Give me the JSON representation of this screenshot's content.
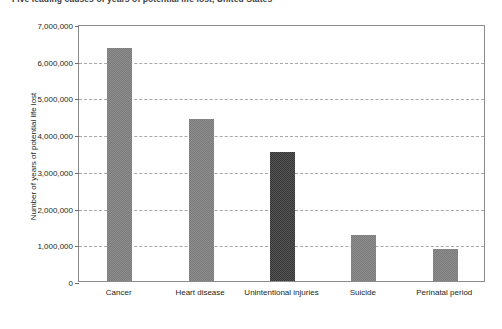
{
  "chart_data": {
    "type": "bar",
    "title": "Five leading causes of years of potential life lost, United States",
    "xlabel": "",
    "ylabel": "Number of years of potential life lost",
    "categories": [
      "Cancer",
      "Heart disease",
      "Unintentional injuries",
      "Suicide",
      "Perinatal period"
    ],
    "values": [
      6350000,
      4400000,
      3520000,
      1250000,
      870000
    ],
    "ylim": [
      0,
      7000000
    ],
    "ytick_labels": [
      "0",
      "1,000,000",
      "2,000,000",
      "3,000,000",
      "4,000,000",
      "5,000,000",
      "6,000,000",
      "7,000,000"
    ],
    "ytick_values": [
      0,
      1000000,
      2000000,
      3000000,
      4000000,
      5000000,
      6000000,
      7000000
    ],
    "grid": true,
    "grid_style": "dashed-horizontal",
    "legend": null,
    "bar_colors": [
      "#7c7c7c",
      "#7c7c7c",
      "#3a3a3a",
      "#7c7c7c",
      "#7c7c7c"
    ],
    "highlight_category": "Unintentional injuries",
    "accent_color": "#3a3a3a",
    "base_color": "#7c7c7c"
  }
}
